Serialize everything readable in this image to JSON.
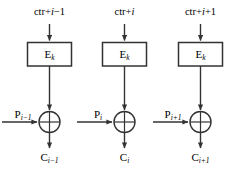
{
  "diagram": {
    "colors": {
      "stroke": "#333333",
      "box_stroke": "#333333",
      "text": "#000000",
      "background": "#ffffff"
    },
    "columns": [
      {
        "id": "block-i-minus-1",
        "counter_label_prefix": "ctr+",
        "counter_label_var": "i",
        "counter_label_suffix": "−1",
        "cipher_label_main": "E",
        "cipher_label_sub": "k",
        "plaintext_label_main": "P",
        "plaintext_label_sub": "i−1",
        "xor_symbol": "xor",
        "ciphertext_label_main": "C",
        "ciphertext_label_sub": "i−1"
      },
      {
        "id": "block-i",
        "counter_label_prefix": "ctr+",
        "counter_label_var": "i",
        "counter_label_suffix": "",
        "cipher_label_main": "E",
        "cipher_label_sub": "k",
        "plaintext_label_main": "P",
        "plaintext_label_sub": "i",
        "xor_symbol": "xor",
        "ciphertext_label_main": "C",
        "ciphertext_label_sub": "i"
      },
      {
        "id": "block-i-plus-1",
        "counter_label_prefix": "ctr+",
        "counter_label_var": "i",
        "counter_label_suffix": "+1",
        "cipher_label_main": "E",
        "cipher_label_sub": "k",
        "plaintext_label_main": "P",
        "plaintext_label_sub": "i+1",
        "xor_symbol": "xor",
        "ciphertext_label_main": "C",
        "ciphertext_label_sub": "i+1"
      }
    ]
  }
}
